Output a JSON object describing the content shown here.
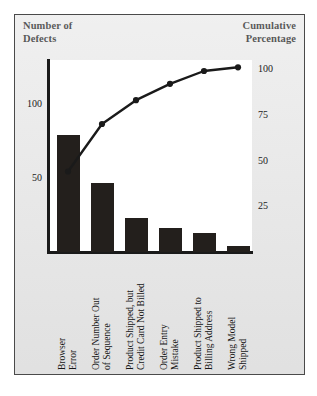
{
  "axis_titles": {
    "left": "Number of\nDefects",
    "left_line1": "Number of",
    "left_line2": "Defects",
    "right_line1": "Cumulative",
    "right_line2": "Percentage"
  },
  "chart_data": {
    "type": "bar",
    "title": "",
    "subtitle": "",
    "categories": [
      "Browser Error",
      "Order Number Out of Sequence",
      "Product Shipped, but Credit Card Not Billed",
      "Order Entry Mistake",
      "Product Shipped to Billing Address",
      "Wrong Model Shipped"
    ],
    "category_lines": [
      [
        "Browser",
        "Error"
      ],
      [
        "Order Number Out",
        "of Sequence"
      ],
      [
        "Product Shipped, but",
        "Credit Card Not Billed"
      ],
      [
        "Order Entry",
        "Mistake"
      ],
      [
        "Product Shipped to",
        "Billing Address"
      ],
      [
        "Wrong Model",
        "Shipped"
      ]
    ],
    "series": [
      {
        "name": "Number of Defects",
        "kind": "bar",
        "values": [
          79,
          47,
          23,
          16,
          13,
          4
        ]
      },
      {
        "name": "Cumulative Percentage",
        "kind": "line",
        "values": [
          44,
          70,
          83,
          92,
          99,
          101
        ]
      }
    ],
    "values": [
      79,
      47,
      23,
      16,
      13,
      4
    ],
    "xlabel": "",
    "ylabel": "Number of Defects",
    "y2label": "Cumulative Percentage",
    "ylim": [
      0,
      130
    ],
    "y2lim": [
      0,
      105
    ],
    "yticks": [
      50,
      100
    ],
    "ytick_labels": [
      "50",
      "100"
    ],
    "y2ticks": [
      25,
      50,
      75,
      100
    ],
    "y2tick_labels": [
      "25",
      "50",
      "75",
      "100"
    ],
    "grid": false,
    "legend": "none",
    "bar_color": "#231f1c",
    "line_color": "#1a1a1a"
  },
  "colors": {
    "page_background": "#ffffff",
    "panel_background": "#e9e9e9",
    "panel_border": "#4a4a4a",
    "plot_background": "#ffffff",
    "axis": "#1a1a1a",
    "text": "#141414"
  }
}
